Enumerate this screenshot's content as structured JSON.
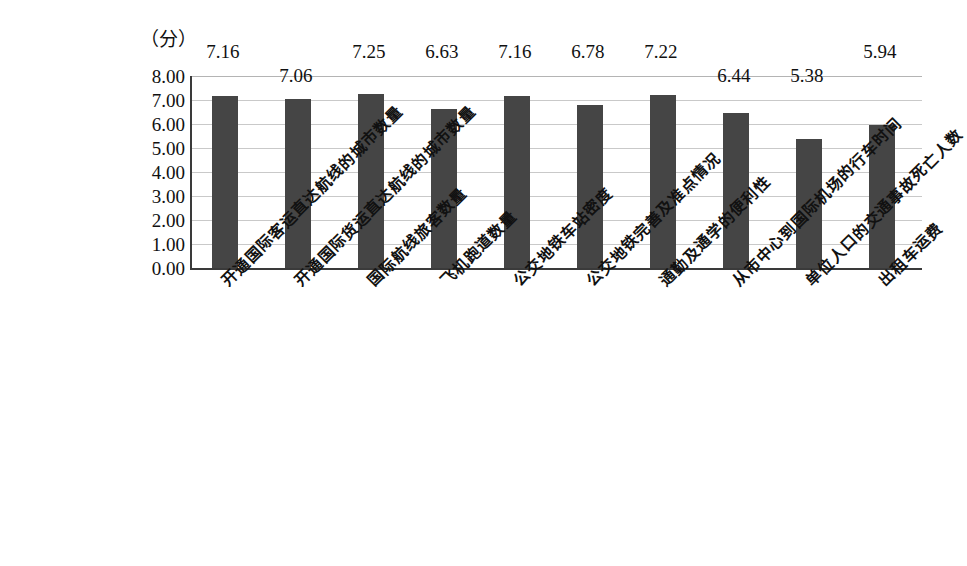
{
  "chart_data": {
    "type": "bar",
    "title": "",
    "subtitle": "",
    "unit_label": "（分）",
    "xlabel": "",
    "ylabel": "",
    "ylim": [
      0,
      8
    ],
    "ytick_step": 1,
    "ytick_labels": [
      "8.00",
      "7.00",
      "6.00",
      "5.00",
      "4.00",
      "3.00",
      "2.00",
      "1.00",
      "0.00"
    ],
    "ytick_values": [
      8,
      7,
      6,
      5,
      4,
      3,
      2,
      1,
      0
    ],
    "grid": true,
    "legend": "none",
    "bar_color": "#454545",
    "axis_color": "#3a3a3a",
    "gridline_color": "#c9c9c9",
    "categories": [
      "开通国际客运直达航线的城市数量",
      "开通国际货运直达航线的城市数量",
      "国际航线旅客数量",
      "飞机跑道数量",
      "公交地铁车站密度",
      "公交地铁完善及准点情况",
      "通勤及通学的便利性",
      "从市中心到国际机场的行车时间",
      "单位人口的交通事故死亡人数",
      "出租车运费"
    ],
    "values": [
      7.16,
      7.06,
      7.25,
      6.63,
      7.16,
      6.78,
      7.22,
      6.44,
      5.38,
      5.94
    ],
    "value_labels": [
      "7.16",
      "7.06",
      "7.25",
      "6.63",
      "7.16",
      "6.78",
      "7.22",
      "6.44",
      "5.38",
      "5.94"
    ],
    "label_row": [
      0,
      1,
      0,
      0,
      0,
      0,
      0,
      1,
      1,
      0
    ]
  }
}
